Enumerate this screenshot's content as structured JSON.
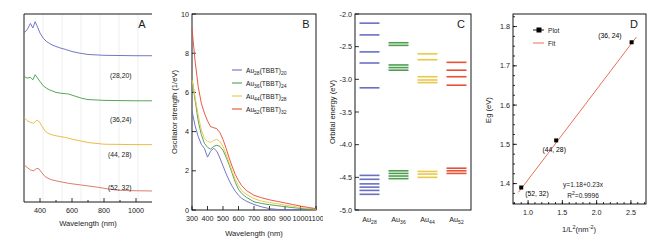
{
  "figure": {
    "panels": [
      "A",
      "B",
      "C",
      "D"
    ]
  },
  "panelA": {
    "letter": "A",
    "xlabel": "Wavelength (nm)",
    "xticks": [
      "400",
      "600",
      "800",
      "1000"
    ],
    "xlim": [
      300,
      1100
    ],
    "curve_labels": [
      "(28,20)",
      "(36,24)",
      "(44, 28)",
      "(52, 32)"
    ],
    "colors": [
      "#6b6fc4",
      "#4f9e50",
      "#e9b93c",
      "#d9756a"
    ],
    "note": "Stacked/offset optical absorption spectra, no y-axis ticks"
  },
  "panelB": {
    "letter": "B",
    "xlabel": "Wavelength (nm)",
    "ylabel": "Oscillator strength (1/eV)",
    "xticks": [
      "300",
      "400",
      "500",
      "600",
      "700",
      "800",
      "900",
      "1000",
      "1100"
    ],
    "yticks": [
      "0",
      "2",
      "4",
      "6",
      "8",
      "10"
    ],
    "xlim": [
      300,
      1100
    ],
    "ylim": [
      0,
      10
    ],
    "legend": [
      {
        "base": "Au",
        "sub1": "28",
        "mid": "(TBBT)",
        "sub2": "20",
        "color": "#6b6fc4"
      },
      {
        "base": "Au",
        "sub1": "36",
        "mid": "(TBBT)",
        "sub2": "24",
        "color": "#4f9e50"
      },
      {
        "base": "Au",
        "sub1": "44",
        "mid": "(TBBT)",
        "sub2": "28",
        "color": "#e9c84a"
      },
      {
        "base": "Au",
        "sub1": "52",
        "mid": "(TBBT)",
        "sub2": "32",
        "color": "#e8503a"
      }
    ]
  },
  "panelC": {
    "letter": "C",
    "ylabel": "Orbital energy (eV)",
    "yticks": [
      "-2.0",
      "-2.5",
      "-3.0",
      "-3.5",
      "-4.0",
      "-4.5",
      "-5.0"
    ],
    "ylim": [
      -5.0,
      -2.0
    ],
    "categories": [
      {
        "base": "Au",
        "sub": "28",
        "color": "#6b6fc4"
      },
      {
        "base": "Au",
        "sub": "36",
        "color": "#4f9e50"
      },
      {
        "base": "Au",
        "sub": "44",
        "color": "#e9c84a"
      },
      {
        "base": "Au",
        "sub": "52",
        "color": "#e8503a"
      }
    ],
    "levels": {
      "Au28": [
        -2.14,
        -2.32,
        -2.58,
        -2.75,
        -3.13,
        -4.47,
        -4.53,
        -4.6,
        -4.65,
        -4.7,
        -4.76
      ],
      "Au36": [
        -2.44,
        -2.48,
        -2.78,
        -2.82,
        -2.86,
        -4.4,
        -4.44,
        -4.48,
        -4.52
      ],
      "Au44": [
        -2.61,
        -2.7,
        -2.96,
        -3.01,
        -3.05,
        -4.41,
        -4.45,
        -4.5
      ],
      "Au52": [
        -2.74,
        -2.86,
        -2.96,
        -3.09,
        -4.36,
        -4.4,
        -4.44
      ]
    }
  },
  "panelD": {
    "letter": "D",
    "xlabel": "1/L²(nm⁻²)",
    "ylabel": "Eg (eV)",
    "xticks": [
      "1.0",
      "1.5",
      "2.0",
      "2.5"
    ],
    "yticks": [
      "1.4",
      "1.5",
      "1.6",
      "1.7",
      "1.8"
    ],
    "xlim": [
      0.8,
      2.7
    ],
    "ylim": [
      1.35,
      1.83
    ],
    "legend": [
      {
        "label": "Plot",
        "marker": "square",
        "color": "#000000"
      },
      {
        "label": "Fit",
        "marker": "line",
        "color": "#e8705a"
      }
    ],
    "points": [
      {
        "x": 2.51,
        "y": 1.76,
        "label": "(36, 24)"
      },
      {
        "x": 1.41,
        "y": 1.51,
        "label": "(44, 28)"
      },
      {
        "x": 0.9,
        "y": 1.39,
        "label": "(52, 32)"
      }
    ],
    "equation": "y=1.18+0.23x",
    "r2_base": "R",
    "r2_exp": "2",
    "r2_value": "=0.9996",
    "fit_slope": 0.23,
    "fit_intercept": 1.18
  },
  "chart_data": [
    {
      "type": "line",
      "panel": "A",
      "title": "",
      "xlabel": "Wavelength (nm)",
      "ylabel": "",
      "xlim": [
        300,
        1100
      ],
      "grid": "vertical-light",
      "legend_position": "inline-right",
      "series": [
        {
          "name": "(28,20)",
          "color": "#6b6fc4",
          "offset": 3.0,
          "x": [
            300,
            320,
            340,
            355,
            370,
            385,
            400,
            420,
            440,
            460,
            480,
            500,
            530,
            560,
            600,
            650,
            700,
            800,
            900,
            1000,
            1100
          ],
          "values": [
            0.72,
            0.8,
            0.95,
            0.84,
            0.99,
            0.86,
            0.72,
            0.6,
            0.52,
            0.47,
            0.43,
            0.4,
            0.36,
            0.33,
            0.28,
            0.24,
            0.21,
            0.19,
            0.185,
            0.18,
            0.18
          ]
        },
        {
          "name": "(36,24)",
          "color": "#4f9e50",
          "offset": 2.0,
          "x": [
            300,
            320,
            340,
            355,
            370,
            385,
            400,
            420,
            440,
            460,
            480,
            500,
            530,
            560,
            580,
            620,
            660,
            700,
            800,
            900,
            1000,
            1100
          ],
          "values": [
            0.74,
            0.7,
            0.72,
            0.66,
            0.78,
            0.7,
            0.62,
            0.52,
            0.46,
            0.42,
            0.39,
            0.36,
            0.34,
            0.33,
            0.32,
            0.27,
            0.22,
            0.19,
            0.17,
            0.165,
            0.16,
            0.16
          ]
        },
        {
          "name": "(44, 28)",
          "color": "#e9b93c",
          "offset": 1.0,
          "x": [
            300,
            320,
            340,
            360,
            380,
            395,
            410,
            430,
            450,
            470,
            500,
            530,
            560,
            600,
            650,
            700,
            750,
            800,
            900,
            1000,
            1100
          ],
          "values": [
            0.82,
            0.74,
            0.7,
            0.68,
            0.75,
            0.72,
            0.62,
            0.5,
            0.44,
            0.41,
            0.38,
            0.36,
            0.34,
            0.3,
            0.26,
            0.22,
            0.2,
            0.18,
            0.175,
            0.17,
            0.17
          ]
        },
        {
          "name": "(52, 32)",
          "color": "#d9756a",
          "offset": 0.0,
          "x": [
            300,
            320,
            340,
            360,
            380,
            395,
            410,
            430,
            450,
            470,
            500,
            540,
            580,
            620,
            660,
            700,
            760,
            820,
            880,
            940,
            1000,
            1100
          ],
          "values": [
            0.74,
            0.68,
            0.62,
            0.6,
            0.66,
            0.64,
            0.56,
            0.47,
            0.42,
            0.39,
            0.36,
            0.33,
            0.3,
            0.28,
            0.26,
            0.24,
            0.21,
            0.17,
            0.14,
            0.13,
            0.125,
            0.12
          ]
        }
      ]
    },
    {
      "type": "line",
      "panel": "B",
      "title": "",
      "xlabel": "Wavelength (nm)",
      "ylabel": "Oscillator strength (1/eV)",
      "xlim": [
        300,
        1100
      ],
      "ylim": [
        0,
        10
      ],
      "grid": "none",
      "legend_position": "upper-center",
      "x": [
        300,
        320,
        340,
        360,
        380,
        400,
        420,
        440,
        460,
        480,
        500,
        520,
        540,
        560,
        580,
        600,
        620,
        650,
        700,
        750,
        800,
        850,
        900,
        950,
        1000,
        1050,
        1100
      ],
      "series": [
        {
          "name": "Au28(TBBT)20",
          "color": "#6b6fc4",
          "values": [
            5.05,
            4.3,
            3.75,
            3.35,
            3.15,
            2.7,
            3.0,
            3.15,
            3.0,
            2.65,
            2.25,
            1.85,
            1.5,
            1.2,
            0.95,
            0.75,
            0.6,
            0.45,
            0.28,
            0.16,
            0.07,
            0.03,
            0.02,
            0.02,
            0.02,
            0.02,
            0.02
          ]
        },
        {
          "name": "Au36(TBBT)24",
          "color": "#4f9e50",
          "values": [
            6.75,
            5.6,
            4.55,
            3.85,
            3.4,
            3.2,
            3.1,
            3.25,
            3.3,
            3.25,
            3.05,
            2.7,
            2.3,
            1.85,
            1.4,
            1.05,
            0.85,
            0.65,
            0.42,
            0.33,
            0.27,
            0.22,
            0.17,
            0.12,
            0.08,
            0.05,
            0.04
          ]
        },
        {
          "name": "Au44(TBBT)28",
          "color": "#e9c84a",
          "values": [
            6.65,
            5.75,
            4.85,
            4.1,
            3.65,
            3.5,
            3.45,
            3.55,
            3.6,
            3.5,
            3.25,
            2.85,
            2.4,
            1.95,
            1.55,
            1.25,
            1.0,
            0.8,
            0.58,
            0.45,
            0.38,
            0.32,
            0.25,
            0.19,
            0.12,
            0.08,
            0.05
          ]
        },
        {
          "name": "Au52(TBBT)32",
          "color": "#e8503a",
          "values": [
            9.25,
            7.6,
            6.3,
            5.45,
            4.95,
            4.55,
            4.25,
            4.2,
            4.15,
            3.95,
            3.6,
            3.15,
            2.65,
            2.2,
            1.8,
            1.5,
            1.25,
            1.0,
            0.75,
            0.62,
            0.52,
            0.44,
            0.36,
            0.28,
            0.2,
            0.13,
            0.07
          ]
        }
      ]
    },
    {
      "type": "scatter",
      "panel": "C",
      "title": "",
      "xlabel": "",
      "ylabel": "Orbital energy (eV)",
      "categories": [
        "Au28",
        "Au36",
        "Au44",
        "Au52"
      ],
      "ylim": [
        -5.0,
        -2.0
      ],
      "grid": "none",
      "legend_position": "none",
      "series": [
        {
          "name": "Au28",
          "color": "#6b6fc4",
          "values": [
            -2.14,
            -2.32,
            -2.58,
            -2.75,
            -3.13,
            -4.47,
            -4.53,
            -4.6,
            -4.65,
            -4.7,
            -4.76
          ]
        },
        {
          "name": "Au36",
          "color": "#4f9e50",
          "values": [
            -2.44,
            -2.48,
            -2.78,
            -2.82,
            -2.86,
            -4.4,
            -4.44,
            -4.48,
            -4.52
          ]
        },
        {
          "name": "Au44",
          "color": "#e9c84a",
          "values": [
            -2.61,
            -2.7,
            -2.96,
            -3.01,
            -3.05,
            -4.41,
            -4.45,
            -4.5
          ]
        },
        {
          "name": "Au52",
          "color": "#e8503a",
          "values": [
            -2.74,
            -2.86,
            -2.96,
            -3.09,
            -4.36,
            -4.4,
            -4.44
          ]
        }
      ]
    },
    {
      "type": "scatter",
      "panel": "D",
      "title": "",
      "xlabel": "1/L2(nm-2)",
      "ylabel": "Eg (eV)",
      "xlim": [
        0.8,
        2.7
      ],
      "ylim": [
        1.35,
        1.83
      ],
      "grid": "none",
      "legend_position": "upper-left",
      "x": [
        0.9,
        1.41,
        2.51
      ],
      "values": [
        1.39,
        1.51,
        1.76
      ],
      "point_labels": [
        "(52, 32)",
        "(44, 28)",
        "(36, 24)"
      ],
      "annotations": [
        "y=1.18+0.23x",
        "R2=0.9996"
      ],
      "series": [
        {
          "name": "Plot",
          "color": "#000000",
          "x": [
            0.9,
            1.41,
            2.51
          ],
          "values": [
            1.39,
            1.51,
            1.76
          ]
        },
        {
          "name": "Fit",
          "color": "#e8705a",
          "x": [
            0.86,
            2.58
          ],
          "values": [
            1.3778,
            1.7734
          ]
        }
      ]
    }
  ]
}
